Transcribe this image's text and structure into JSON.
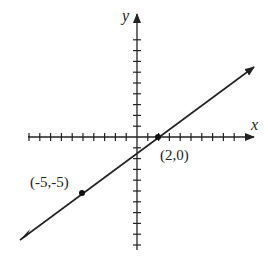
{
  "diagram": {
    "type": "coordinate-plane-line",
    "axes": {
      "x_label": "x",
      "y_label": "y",
      "origin_px": [
        137,
        137
      ],
      "unit_px": 10.8,
      "x_ticks": {
        "min": -10,
        "max": 10
      },
      "y_ticks": {
        "min": -10,
        "max": 10
      }
    },
    "line": {
      "equation": "y = (5/7)(x - 2)",
      "passes_through": [
        [
          -5,
          -5
        ],
        [
          2,
          0
        ]
      ],
      "color": "#222222"
    },
    "points": [
      {
        "label": "(2,0)",
        "x": 2,
        "y": 0
      },
      {
        "label": "(-5,-5)",
        "x": -5,
        "y": -5
      }
    ]
  }
}
